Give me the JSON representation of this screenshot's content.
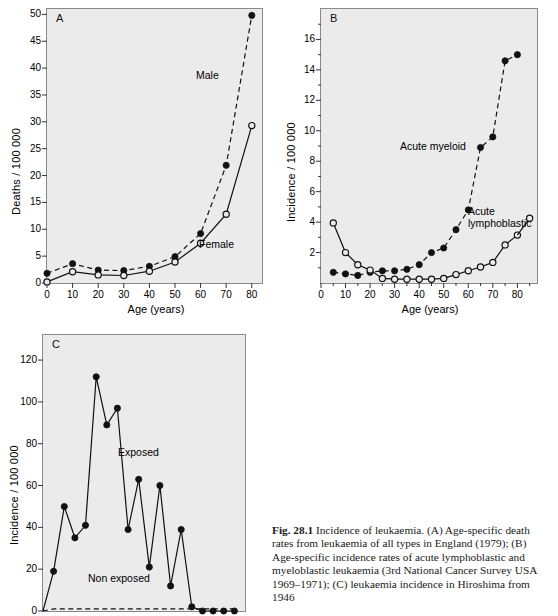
{
  "figure": {
    "caption_label": "Fig. 28.1",
    "caption_text": "Incidence of leukaemia. (A) Age-specific death rates from leukaemia of all types in England (1979); (B) Age-specific incidence rates of acute lymphoblastic and myeloblastic leukaemia (3rd National Cancer Survey USA 1969–1971); (C) leukaemia incidence in Hiroshima from 1946"
  },
  "chart_data": [
    {
      "id": "panel-a",
      "type": "line",
      "panel_letter": "A",
      "title": "",
      "xlabel": "Age (years)",
      "ylabel": "Deaths / 100 000",
      "xlim": [
        0,
        84
      ],
      "ylim": [
        0,
        51
      ],
      "xticks": [
        0,
        10,
        20,
        30,
        40,
        50,
        60,
        70,
        80
      ],
      "yticks": [
        0,
        5,
        10,
        15,
        20,
        25,
        30,
        35,
        40,
        45,
        50
      ],
      "grid": false,
      "legend_position": "inline-annotation",
      "x": [
        0,
        10,
        20,
        30,
        40,
        50,
        60,
        70,
        80
      ],
      "series": [
        {
          "name": "Male",
          "marker": "filled-circle",
          "line": "dashed",
          "values": [
            1.8,
            3.6,
            2.4,
            2.3,
            3.1,
            4.9,
            9.2,
            21.9,
            49.8
          ]
        },
        {
          "name": "Female",
          "marker": "open-circle",
          "line": "solid",
          "values": [
            0.2,
            2.1,
            1.5,
            1.4,
            2.2,
            3.9,
            7.4,
            12.8,
            29.3
          ]
        }
      ]
    },
    {
      "id": "panel-b",
      "type": "line",
      "panel_letter": "B",
      "title": "",
      "xlabel": "Age (years)",
      "ylabel": "Incidence / 100 000",
      "xlim": [
        0,
        88
      ],
      "ylim": [
        0,
        18
      ],
      "xticks": [
        0,
        10,
        20,
        30,
        40,
        50,
        60,
        70,
        80
      ],
      "yticks": [
        2,
        4,
        6,
        8,
        10,
        12,
        14,
        16
      ],
      "grid": false,
      "legend_position": "inline-annotation",
      "x": [
        5,
        10,
        15,
        20,
        25,
        30,
        35,
        40,
        45,
        50,
        55,
        60,
        65,
        70,
        75,
        80
      ],
      "series": [
        {
          "name": "Acute myeloid",
          "marker": "filled-circle",
          "line": "dashed",
          "values": [
            0.7,
            0.6,
            0.5,
            0.7,
            0.8,
            0.8,
            0.9,
            1.2,
            2.0,
            2.3,
            3.5,
            4.8,
            8.9,
            9.6,
            14.6,
            15.0
          ]
        },
        {
          "name": "Acute lymphoblastic",
          "marker": "open-circle",
          "line": "solid",
          "values": [
            3.95,
            2.0,
            1.2,
            0.85,
            0.3,
            0.25,
            0.25,
            0.25,
            0.25,
            0.3,
            0.55,
            0.8,
            1.05,
            1.35,
            2.5,
            3.15
          ]
        },
        {
          "name": "Acute lymphoblastic tail",
          "marker": "open-circle",
          "line": "solid",
          "values": [
            4.25
          ]
        }
      ]
    },
    {
      "id": "panel-c",
      "type": "line",
      "panel_letter": "C",
      "title": "",
      "xlabel": "",
      "ylabel": "Incidence / 100 000",
      "xlim": [
        0,
        19
      ],
      "ylim": [
        0,
        132
      ],
      "xticks": [],
      "yticks": [
        0,
        20,
        40,
        60,
        80,
        100,
        120
      ],
      "grid": false,
      "legend_position": "inline-annotation",
      "x": [
        0,
        1,
        2,
        3,
        4,
        5,
        6,
        7,
        8,
        9,
        10,
        11,
        12,
        13,
        14,
        15,
        16,
        17,
        18
      ],
      "series": [
        {
          "name": "Exposed",
          "marker": "filled-circle",
          "line": "solid",
          "values": [
            0,
            19,
            50,
            35,
            41,
            112,
            89,
            97,
            39,
            63,
            21,
            60,
            12,
            39,
            2,
            0,
            0,
            0,
            0
          ]
        },
        {
          "name": "Non exposed",
          "marker": "none",
          "line": "dashed",
          "values": [
            0,
            1,
            1,
            1,
            1,
            1,
            1,
            1,
            1,
            1,
            1,
            1,
            1,
            1,
            1,
            1,
            1,
            1,
            1
          ]
        }
      ]
    }
  ]
}
